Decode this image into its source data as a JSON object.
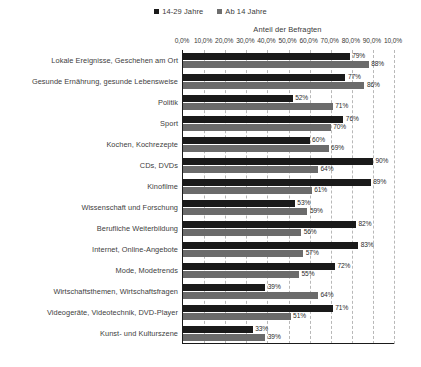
{
  "chart_data": {
    "type": "bar",
    "orientation": "horizontal",
    "title": "",
    "xlabel": "Anteil der Befragten",
    "ylabel": "",
    "xlim": [
      0,
      100
    ],
    "grid": true,
    "legend_position": "top-center",
    "tick_labels": [
      "0,0%",
      "10,0%",
      "20,0%",
      "30,0%",
      "40,0%",
      "50,0%",
      "60,0%",
      "70,0%",
      "80,0%",
      "90,0%",
      "10,0%"
    ],
    "tick_values": [
      0,
      10,
      20,
      30,
      40,
      50,
      60,
      70,
      80,
      90,
      100
    ],
    "categories": [
      "Lokale Ereignisse, Geschehen am Ort",
      "Gesunde Ernährung, gesunde Lebensweise",
      "Politik",
      "Sport",
      "Kochen, Kochrezepte",
      "CDs, DVDs",
      "Kinofilme",
      "Wissenschaft und Forschung",
      "Berufliche Weiterbildung",
      "Internet, Online-Angebote",
      "Mode, Modetrends",
      "Wirtschaftsthemen, Wirtschaftsfragen",
      "Videogeräte, Videotechnik, DVD-Player",
      "Kunst- und Kulturszene"
    ],
    "series": [
      {
        "name": "14-29 Jahre",
        "color": "#1a1a1a",
        "values": [
          79,
          77,
          52,
          76,
          60,
          90,
          89,
          53,
          82,
          83,
          72,
          39,
          71,
          33
        ],
        "labels": [
          "79%",
          "77%",
          "52%",
          "76%",
          "60%",
          "90%",
          "89%",
          "53%",
          "82%",
          "83%",
          "72%",
          "39%",
          "71%",
          "33%"
        ]
      },
      {
        "name": "Ab 14 Jahre",
        "color": "#6b6b6b",
        "values": [
          88,
          86,
          71,
          70,
          69,
          64,
          61,
          59,
          56,
          57,
          55,
          64,
          51,
          39
        ],
        "labels": [
          "88%",
          "86%",
          "71%",
          "70%",
          "69%",
          "64%",
          "61%",
          "59%",
          "56%",
          "57%",
          "55%",
          "64%",
          "51%",
          "39%"
        ]
      }
    ]
  },
  "legend": {
    "items": [
      {
        "label": "14-29 Jahre",
        "color": "#1a1a1a"
      },
      {
        "label": "Ab 14 Jahre",
        "color": "#6b6b6b"
      }
    ]
  },
  "axis": {
    "title": "Anteil der Befragten"
  },
  "caption": {
    "text": ""
  }
}
